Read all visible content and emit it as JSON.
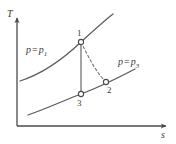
{
  "figure": {
    "type": "T-s diagram",
    "background_color": "#ffffff",
    "stroke_color": "#555555",
    "text_color": "#3a3a3a"
  },
  "axes": {
    "y": {
      "label": "T",
      "name": "temperature-axis",
      "x": 17,
      "top": 18,
      "bottom": 126,
      "label_x": 7,
      "label_y": 9
    },
    "x": {
      "label": "s",
      "name": "entropy-axis",
      "y": 126,
      "left": 17,
      "right": 166,
      "label_x": 161,
      "label_y": 130
    }
  },
  "curves": [
    {
      "id": "isobar-p1",
      "label_p": "p",
      "label_eq": "=",
      "label_sub": "1",
      "label_x": 26,
      "label_y": 45,
      "path": "M 20 81 C 42 74, 62 60, 81 42 C 93 31, 104 21, 113 14",
      "dash": "none"
    },
    {
      "id": "isobar-p3",
      "label_p": "p",
      "label_eq": "=",
      "label_sub": "3",
      "label_x": 118,
      "label_y": 57,
      "path": "M 28 115 C 48 108, 65 100, 81 94 C 97 88, 116 79, 135 69",
      "dash": "none"
    }
  ],
  "process_lines": [
    {
      "id": "isentropic-1-3",
      "name": "process-line-1-3",
      "path": "M 81 42 L 81 94",
      "dash": "none"
    },
    {
      "id": "actual-1-2",
      "name": "process-line-1-2",
      "path": "M 81 42 C 88 56, 95 71, 106 82",
      "dash": "2.6 2.4"
    }
  ],
  "points": [
    {
      "id": "1",
      "label": "1",
      "cx": 81,
      "cy": 42,
      "r": 2.6,
      "label_x": 77,
      "label_y": 29
    },
    {
      "id": "2",
      "label": "2",
      "cx": 106,
      "cy": 82,
      "r": 2.6,
      "label_x": 107,
      "label_y": 86
    },
    {
      "id": "3",
      "label": "3",
      "cx": 81,
      "cy": 94,
      "r": 2.6,
      "label_x": 77,
      "label_y": 99
    }
  ]
}
